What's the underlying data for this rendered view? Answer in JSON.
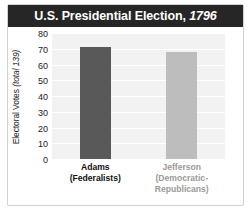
{
  "title": {
    "main": "U.S. Presidential Election,",
    "year": "1796"
  },
  "axis": {
    "y_label_main": "Electoral Votes",
    "y_label_total": "(total 139)",
    "y_ticks": [
      "80",
      "70",
      "60",
      "50",
      "40",
      "30",
      "20",
      "10",
      "0"
    ]
  },
  "categories": [
    {
      "name": "Adams",
      "party": "(Federalists)"
    },
    {
      "name": "Jefferson",
      "party": "(Democratic-",
      "party2": "Republicans)"
    }
  ],
  "colors": {
    "title_bar": "#262626",
    "bar_adams": "#595959",
    "bar_jefferson": "#bdbdbd",
    "plot_background": "#f2f2f2",
    "gridline": "#ffffff"
  },
  "chart_data": {
    "type": "bar",
    "title": "U.S. Presidential Election, 1796",
    "xlabel": "",
    "ylabel": "Electoral Votes (total 139)",
    "categories": [
      "Adams (Federalists)",
      "Jefferson (Democratic-Republicans)"
    ],
    "values": [
      71,
      68
    ],
    "ylim": [
      0,
      80
    ],
    "yticks": [
      0,
      10,
      20,
      30,
      40,
      50,
      60,
      70,
      80
    ],
    "grid": true,
    "legend": "none",
    "total_electoral_votes": 139,
    "year": 1796
  }
}
